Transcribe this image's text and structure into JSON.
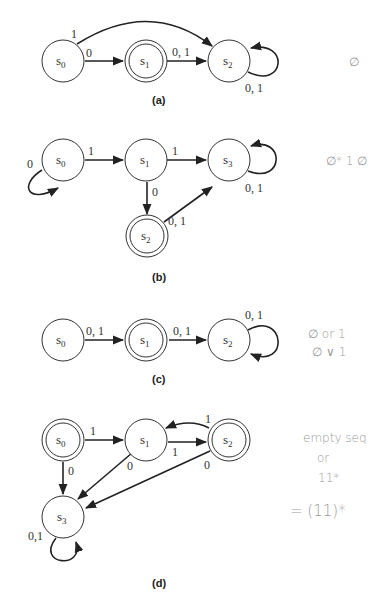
{
  "diagrams": [
    {
      "caption": "(a)",
      "states": [
        {
          "id": "s0",
          "label": "s",
          "sub": "0",
          "accepting": false
        },
        {
          "id": "s1",
          "label": "s",
          "sub": "1",
          "accepting": true
        },
        {
          "id": "s2",
          "label": "s",
          "sub": "2",
          "accepting": false
        }
      ],
      "transitions": [
        {
          "from": "s0",
          "to": "s2",
          "label": "1"
        },
        {
          "from": "s0",
          "to": "s1",
          "label": "0"
        },
        {
          "from": "s1",
          "to": "s2",
          "label": "0, 1"
        },
        {
          "from": "s2",
          "to": "s2",
          "label": "0, 1"
        }
      ],
      "annotation": [
        "∅"
      ]
    },
    {
      "caption": "(b)",
      "states": [
        {
          "id": "s0",
          "label": "s",
          "sub": "0",
          "accepting": false
        },
        {
          "id": "s1",
          "label": "s",
          "sub": "1",
          "accepting": false
        },
        {
          "id": "s2",
          "label": "s",
          "sub": "2",
          "accepting": true
        },
        {
          "id": "s3",
          "label": "s",
          "sub": "3",
          "accepting": false
        }
      ],
      "transitions": [
        {
          "from": "s0",
          "to": "s0",
          "label": "0"
        },
        {
          "from": "s0",
          "to": "s1",
          "label": "1"
        },
        {
          "from": "s1",
          "to": "s3",
          "label": "1"
        },
        {
          "from": "s1",
          "to": "s2",
          "label": "0"
        },
        {
          "from": "s2",
          "to": "s3",
          "label": "0, 1"
        },
        {
          "from": "s3",
          "to": "s3",
          "label": "0, 1"
        }
      ],
      "annotation": [
        "∅* 1 ∅"
      ]
    },
    {
      "caption": "(c)",
      "states": [
        {
          "id": "s0",
          "label": "s",
          "sub": "0",
          "accepting": false
        },
        {
          "id": "s1",
          "label": "s",
          "sub": "1",
          "accepting": true
        },
        {
          "id": "s2",
          "label": "s",
          "sub": "2",
          "accepting": false
        }
      ],
      "transitions": [
        {
          "from": "s0",
          "to": "s1",
          "label": "0, 1"
        },
        {
          "from": "s1",
          "to": "s2",
          "label": "0, 1"
        },
        {
          "from": "s2",
          "to": "s2",
          "label": "0, 1"
        }
      ],
      "annotation": [
        "∅ or 1",
        "∅ ∨ 1"
      ]
    },
    {
      "caption": "(d)",
      "states": [
        {
          "id": "s0",
          "label": "s",
          "sub": "0",
          "accepting": true
        },
        {
          "id": "s1",
          "label": "s",
          "sub": "1",
          "accepting": false
        },
        {
          "id": "s2",
          "label": "s",
          "sub": "2",
          "accepting": true
        },
        {
          "id": "s3",
          "label": "s",
          "sub": "3",
          "accepting": false
        }
      ],
      "transitions": [
        {
          "from": "s0",
          "to": "s1",
          "label": "1"
        },
        {
          "from": "s0",
          "to": "s3",
          "label": "0"
        },
        {
          "from": "s1",
          "to": "s2",
          "label": "1"
        },
        {
          "from": "s2",
          "to": "s1",
          "label": "1"
        },
        {
          "from": "s1",
          "to": "s3",
          "label": "0"
        },
        {
          "from": "s2",
          "to": "s3",
          "label": "0"
        },
        {
          "from": "s3",
          "to": "s3",
          "label": "0,1"
        }
      ],
      "annotation": [
        "empty seq",
        "or",
        "11*",
        "= (11)*"
      ]
    }
  ]
}
